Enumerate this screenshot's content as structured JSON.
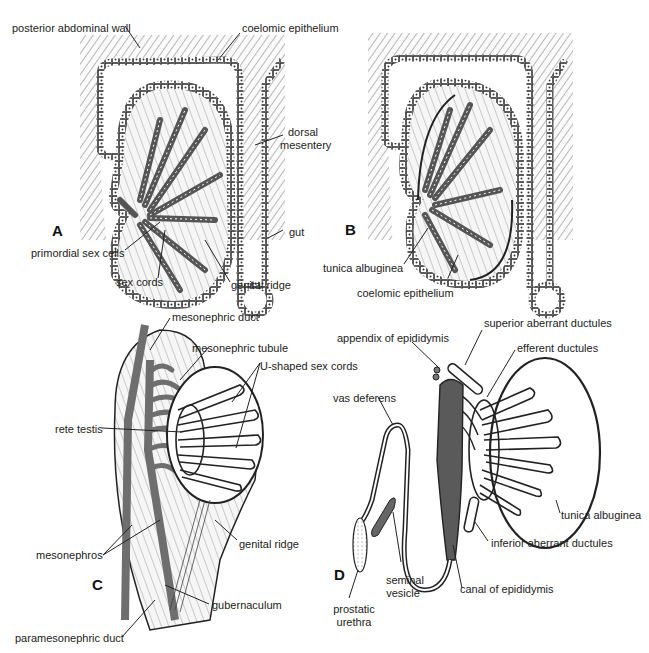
{
  "panels": {
    "A": {
      "letter": "A",
      "labels": {
        "posterior_abdominal_wall": "posterior abdominal wall",
        "coelomic_epithelium": "coelomic epithelium",
        "dorsal_mesentery_1": "dorsal",
        "dorsal_mesentery_2": "mesentery",
        "gut": "gut",
        "primordial_sex_cells": "primordial sex cells",
        "sex_cords": "sex cords",
        "genital_ridge": "genital ridge"
      }
    },
    "B": {
      "letter": "B",
      "labels": {
        "tunica_albuginea": "tunica albuginea",
        "coelomic_epithelium": "coelomic epithelium"
      }
    },
    "C": {
      "letter": "C",
      "labels": {
        "mesonephric_duct": "mesonephric duct",
        "mesonephric_tubule": "mesonephric tubule",
        "u_shaped_sex_cords": "U-shaped sex cords",
        "rete_testis": "rete testis",
        "mesonephros": "mesonephros",
        "genital_ridge": "genital ridge",
        "gubernaculum": "gubernaculum",
        "paramesonephric_duct": "paramesonephric duct"
      }
    },
    "D": {
      "letter": "D",
      "labels": {
        "appendix_of_epididymis": "appendix of epididymis",
        "superior_aberrant_ductules": "superior aberrant ductules",
        "efferent_ductules": "efferent ductules",
        "vas_deferens": "vas deferens",
        "tunica_albuginea": "tunica albuginea",
        "inferior_aberrant_ductules": "inferior aberrant ductules",
        "seminal_vesicle_1": "seminal",
        "seminal_vesicle_2": "vesicle",
        "canal_of_epididymis": "canal of epididymis",
        "prostatic_urethra_1": "prostatic",
        "prostatic_urethra_2": "urethra"
      }
    }
  },
  "colors": {
    "ink": "#222222",
    "duct_fill": "#6e6e6e",
    "tissue_fill": "#eeeeee",
    "epididymis_fill": "#555555"
  }
}
